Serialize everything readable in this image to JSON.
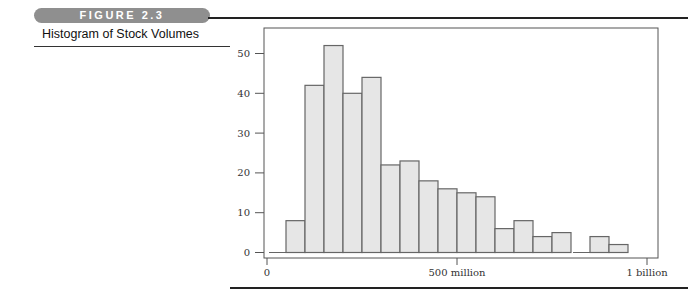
{
  "figure": {
    "badge": "FIGURE 2.3",
    "caption": "Histogram of Stock Volumes"
  },
  "colors": {
    "bar_fill": "#e6e6e6",
    "bar_stroke": "#666666",
    "badge_bg": "#8f8f8f",
    "rule": "#222222"
  },
  "chart_data": {
    "type": "bar",
    "title": "Histogram of Stock Volumes",
    "xlabel": "",
    "ylabel": "",
    "bin_width": 50000000,
    "bin_edges_millions": [
      0,
      50,
      100,
      150,
      200,
      250,
      300,
      350,
      400,
      450,
      500,
      550,
      600,
      650,
      700,
      750,
      800,
      850,
      900,
      950
    ],
    "categories": [
      "0-50M",
      "50-100M",
      "100-150M",
      "150-200M",
      "200-250M",
      "250-300M",
      "300-350M",
      "350-400M",
      "400-450M",
      "450-500M",
      "500-550M",
      "550-600M",
      "600-650M",
      "650-700M",
      "700-750M",
      "750-800M",
      "800-850M",
      "850-900M",
      "900-950M"
    ],
    "values": [
      0,
      8,
      42,
      52,
      40,
      44,
      22,
      23,
      18,
      16,
      15,
      14,
      6,
      8,
      4,
      5,
      0,
      4,
      2
    ],
    "ylim": [
      0,
      56
    ],
    "yticks": [
      0,
      10,
      20,
      30,
      40,
      50
    ],
    "xticks": [
      {
        "value": 0,
        "label": "0"
      },
      {
        "value": 500000000,
        "label": "500 million"
      },
      {
        "value": 1000000000,
        "label": "1 billion"
      }
    ],
    "grid": false,
    "legend": null
  }
}
